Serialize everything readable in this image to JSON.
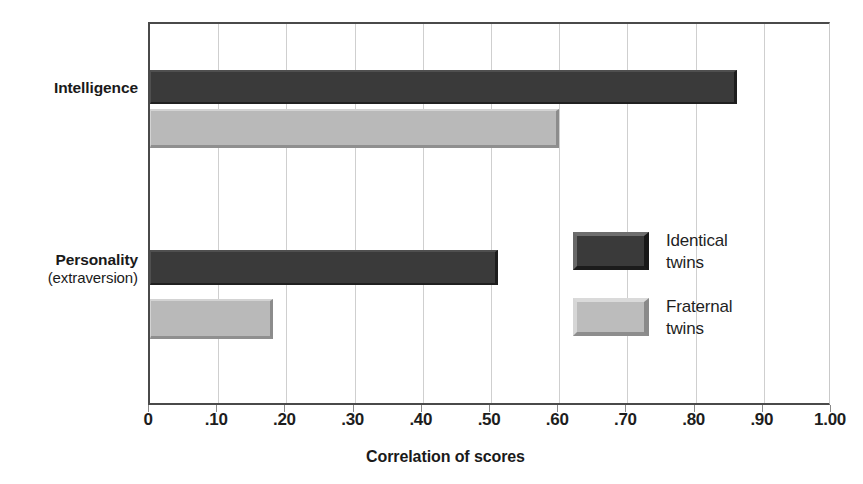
{
  "chart_data": {
    "type": "bar",
    "orientation": "horizontal",
    "title": "",
    "xlabel": "Correlation of scores",
    "ylabel": "",
    "xlim": [
      0,
      1.0
    ],
    "xticks": [
      0,
      0.1,
      0.2,
      0.3,
      0.4,
      0.5,
      0.6,
      0.7,
      0.8,
      0.9,
      1.0
    ],
    "xtick_labels": [
      "0",
      ".10",
      ".20",
      ".30",
      ".40",
      ".50",
      ".60",
      ".70",
      ".80",
      ".90",
      "1.00"
    ],
    "grid": "vertical",
    "legend_position": "inside-right",
    "categories": [
      "Intelligence",
      "Personality (extraversion)"
    ],
    "category_labels": [
      {
        "main": "Intelligence",
        "sub": ""
      },
      {
        "main": "Personality",
        "sub": "(extraversion)"
      }
    ],
    "series": [
      {
        "name": "Identical twins",
        "legend_label_lines": [
          "Identical",
          "twins"
        ],
        "color": "#3a3a3a",
        "values": [
          0.86,
          0.51
        ]
      },
      {
        "name": "Fraternal twins",
        "legend_label_lines": [
          "Fraternal",
          "twins"
        ],
        "color": "#b9b9b9",
        "values": [
          0.6,
          0.18
        ]
      }
    ]
  },
  "colors": {
    "identical_twins": "#3a3a3a",
    "fraternal_twins": "#b9b9b9",
    "axis": "#4a4a4a",
    "gridline": "#cfcfcf",
    "text": "#1a1a1a",
    "background": "#ffffff"
  },
  "geometry": {
    "plot_left": 148,
    "plot_top": 22,
    "plot_width": 682,
    "plot_height": 383,
    "bars": [
      {
        "series": 0,
        "category": 0,
        "top": 46,
        "height": 34
      },
      {
        "series": 1,
        "category": 0,
        "top": 85,
        "height": 39
      },
      {
        "series": 0,
        "category": 1,
        "top": 226,
        "height": 35
      },
      {
        "series": 1,
        "category": 1,
        "top": 275,
        "height": 40
      }
    ],
    "category_label_tops": [
      78,
      250
    ]
  }
}
